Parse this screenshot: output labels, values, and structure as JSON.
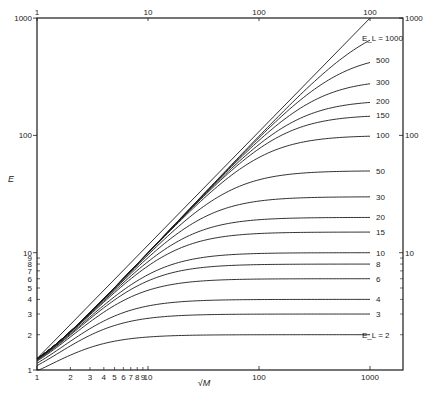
{
  "chart_data": {
    "type": "line",
    "title": "",
    "xlabel": "√M",
    "ylabel": "E",
    "x_scale": "log",
    "y_scale": "log",
    "xlim": [
      1,
      1000
    ],
    "ylim": [
      1,
      1000
    ],
    "grid": false,
    "legend_position": "inline-right",
    "x_ticks_bottom": {
      "major": [
        {
          "value": 1,
          "label": "1"
        },
        {
          "value": 10,
          "label": "10"
        },
        {
          "value": 100,
          "label": "100"
        },
        {
          "value": 1000,
          "label": "1000"
        }
      ],
      "minor_labeled": [
        {
          "value": 2,
          "label": "2"
        },
        {
          "value": 3,
          "label": "3"
        },
        {
          "value": 4,
          "label": "4"
        },
        {
          "value": 5,
          "label": "5"
        },
        {
          "value": 6,
          "label": "6"
        },
        {
          "value": 7,
          "label": "7"
        },
        {
          "value": 8,
          "label": "8"
        },
        {
          "value": 9,
          "label": "9"
        }
      ]
    },
    "x_ticks_top": [
      {
        "value": 1,
        "label": "1"
      },
      {
        "value": 10,
        "label": "10"
      },
      {
        "value": 100,
        "label": "100"
      },
      {
        "value": 1000,
        "label": "100"
      }
    ],
    "y_ticks_left": {
      "major": [
        {
          "value": 1,
          "label": "1"
        },
        {
          "value": 10,
          "label": "10"
        },
        {
          "value": 100,
          "label": "100"
        },
        {
          "value": 1000,
          "label": "1000"
        }
      ],
      "minor_labeled": [
        {
          "value": 2,
          "label": "2"
        },
        {
          "value": 3,
          "label": "3"
        },
        {
          "value": 4,
          "label": "4"
        },
        {
          "value": 5,
          "label": "5"
        },
        {
          "value": 6,
          "label": "6"
        },
        {
          "value": 7,
          "label": "7"
        },
        {
          "value": 8,
          "label": "8"
        },
        {
          "value": 9,
          "label": "9"
        }
      ]
    },
    "y_ticks_right": [
      {
        "value": 10,
        "label": "10"
      },
      {
        "value": 100,
        "label": "100"
      },
      {
        "value": 1000,
        "label": "1000"
      }
    ],
    "series_parameter": "E_L",
    "start_value_at_x1": 1.25,
    "series": [
      {
        "name": "E_L = 1000",
        "E_L": 1000,
        "label": "E_L = 1000",
        "end_value": 680
      },
      {
        "name": "E_L = 500",
        "E_L": 500,
        "label": "500",
        "end_value": 440
      },
      {
        "name": "E_L = 300",
        "E_L": 300,
        "label": "300",
        "end_value": 285
      },
      {
        "name": "E_L = 200",
        "E_L": 200,
        "label": "200",
        "end_value": 195
      },
      {
        "name": "E_L = 150",
        "E_L": 150,
        "label": "150",
        "end_value": 148
      },
      {
        "name": "E_L = 100",
        "E_L": 100,
        "label": "100",
        "end_value": 100
      },
      {
        "name": "E_L = 50",
        "E_L": 50,
        "label": "50",
        "end_value": 50
      },
      {
        "name": "E_L = 30",
        "E_L": 30,
        "label": "30",
        "end_value": 30
      },
      {
        "name": "E_L = 20",
        "E_L": 20,
        "label": "20",
        "end_value": 20
      },
      {
        "name": "E_L = 15",
        "E_L": 15,
        "label": "15",
        "end_value": 15
      },
      {
        "name": "E_L = 10",
        "E_L": 10,
        "label": "10",
        "end_value": 10
      },
      {
        "name": "E_L = 8",
        "E_L": 8,
        "label": "8",
        "end_value": 8
      },
      {
        "name": "E_L = 6",
        "E_L": 6,
        "label": "6",
        "end_value": 6
      },
      {
        "name": "E_L = 4",
        "E_L": 4,
        "label": "4",
        "end_value": 4
      },
      {
        "name": "E_L = 3",
        "E_L": 3,
        "label": "3",
        "end_value": 3
      },
      {
        "name": "E_L = 2",
        "E_L": 2,
        "label": "E_L = 2",
        "end_value": 2
      }
    ],
    "asymptote": {
      "name": "E = √M (E_L → ∞)",
      "points": [
        [
          1,
          1.25
        ],
        [
          1000,
          1000
        ]
      ]
    }
  },
  "layout": {
    "plot_left": 37,
    "plot_right": 403,
    "plot_top": 18,
    "plot_bottom": 370,
    "x_px_per_decade": 111,
    "y_px_per_decade": 117.3,
    "curve_end_x": 1000,
    "line_color": "#1a1a1a"
  }
}
